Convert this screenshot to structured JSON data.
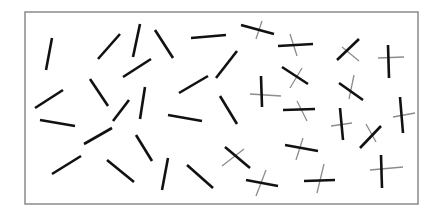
{
  "canvas": {
    "width": 438,
    "height": 216,
    "background": "#ffffff"
  },
  "frame": {
    "x": 25,
    "y": 12,
    "width": 393,
    "height": 192,
    "stroke": "#8a8a8a",
    "stroke_width": 1.5
  },
  "colors": {
    "target": "#111111",
    "distractor_cross": "#8c8c8c"
  },
  "stimulus": {
    "description": "Field of oriented line segments; left region contains plain black bars, right region contains black bars each crossed by a thin grey line.",
    "plain_bars": [
      [
        52,
        38,
        46,
        70
      ],
      [
        98,
        59,
        120,
        34
      ],
      [
        133,
        57,
        140,
        24
      ],
      [
        155,
        30,
        173,
        58
      ],
      [
        123,
        77,
        151,
        59
      ],
      [
        191,
        38,
        226,
        35
      ],
      [
        35,
        108,
        63,
        90
      ],
      [
        90,
        79,
        108,
        106
      ],
      [
        145,
        87,
        140,
        119
      ],
      [
        179,
        93,
        208,
        76
      ],
      [
        216,
        78,
        237,
        51
      ],
      [
        40,
        120,
        75,
        126
      ],
      [
        168,
        115,
        202,
        121
      ],
      [
        84,
        144,
        112,
        128
      ],
      [
        113,
        121,
        129,
        100
      ],
      [
        220,
        96,
        237,
        124
      ],
      [
        52,
        174,
        81,
        156
      ],
      [
        107,
        160,
        134,
        182
      ],
      [
        136,
        135,
        152,
        161
      ],
      [
        162,
        190,
        168,
        158
      ],
      [
        187,
        165,
        213,
        188
      ]
    ],
    "crossed_items": [
      {
        "bar": [
          241,
          25,
          274,
          34
        ],
        "cross": [
          256,
          39,
          262,
          21
        ]
      },
      {
        "bar": [
          278,
          46,
          313,
          44
        ],
        "cross": [
          297,
          56,
          290,
          34
        ]
      },
      {
        "bar": [
          337,
          60,
          359,
          39
        ],
        "cross": [
          342,
          47,
          359,
          61
        ]
      },
      {
        "bar": [
          388,
          45,
          389,
          78
        ],
        "cross": [
          378,
          58,
          404,
          57
        ]
      },
      {
        "bar": [
          282,
          67,
          308,
          84
        ],
        "cross": [
          290,
          88,
          302,
          68
        ]
      },
      {
        "bar": [
          261,
          76,
          262,
          107
        ],
        "cross": [
          250,
          94,
          281,
          96
        ]
      },
      {
        "bar": [
          339,
          83,
          363,
          100
        ],
        "cross": [
          349,
          99,
          354,
          75
        ]
      },
      {
        "bar": [
          283,
          110,
          315,
          109
        ],
        "cross": [
          297,
          101,
          307,
          121
        ]
      },
      {
        "bar": [
          400,
          97,
          403,
          133
        ],
        "cross": [
          393,
          117,
          415,
          113
        ]
      },
      {
        "bar": [
          340,
          108,
          343,
          140
        ],
        "cross": [
          331,
          126,
          352,
          123
        ]
      },
      {
        "bar": [
          360,
          148,
          381,
          126
        ],
        "cross": [
          366,
          124,
          376,
          142
        ]
      },
      {
        "bar": [
          285,
          145,
          318,
          151
        ],
        "cross": [
          296,
          160,
          303,
          138
        ]
      },
      {
        "bar": [
          225,
          147,
          250,
          168
        ],
        "cross": [
          222,
          166,
          244,
          149
        ]
      },
      {
        "bar": [
          246,
          180,
          278,
          186
        ],
        "cross": [
          256,
          196,
          266,
          170
        ]
      },
      {
        "bar": [
          304,
          181,
          335,
          180
        ],
        "cross": [
          317,
          193,
          324,
          164
        ]
      },
      {
        "bar": [
          381,
          155,
          382,
          188
        ],
        "cross": [
          370,
          170,
          403,
          167
        ]
      }
    ]
  }
}
